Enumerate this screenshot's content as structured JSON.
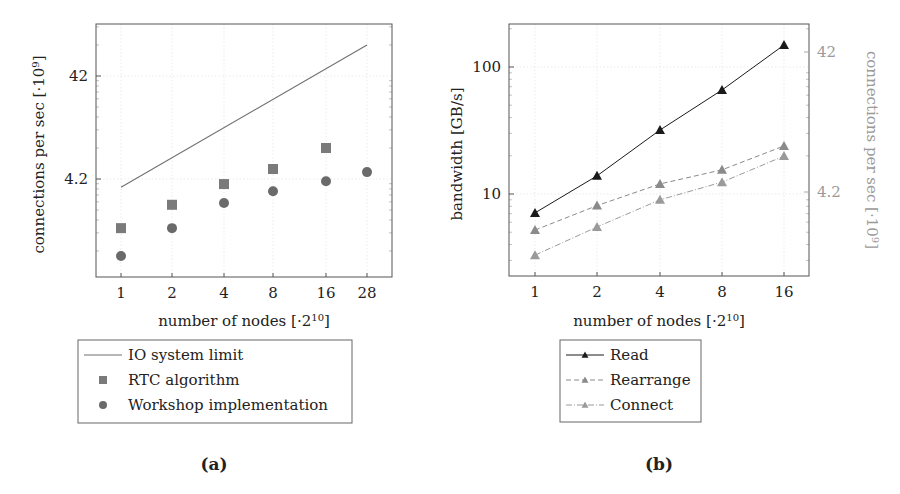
{
  "chart_data": [
    {
      "id": "a",
      "type": "scatter",
      "caption": "(a)",
      "title": "",
      "xlabel": "number of nodes [·2^10]",
      "xlabel_parts": {
        "base": "number of nodes [·2",
        "sup": "10",
        "end": "]"
      },
      "ylabel": "connections per sec [·10^9]",
      "ylabel_parts": {
        "base": "connections per sec [·10",
        "sup": "9",
        "end": "]"
      },
      "x": [
        1,
        2,
        4,
        8,
        16,
        28
      ],
      "x_tick_labels": [
        "1",
        "2",
        "4",
        "8",
        "16",
        "28"
      ],
      "y_scale": "log",
      "y_tick_labels": [
        "4.2",
        "42"
      ],
      "ylim": [
        0.6,
        120
      ],
      "grid": true,
      "legend_position": "below",
      "series": [
        {
          "name": "IO system limit",
          "style": "line",
          "color": "#707070",
          "x": [
            1,
            28
          ],
          "values": [
            3.5,
            84
          ]
        },
        {
          "name": "RTC algorithm",
          "style": "square-marker",
          "color": "#7a7a7a",
          "x": [
            1,
            2,
            4,
            8,
            16
          ],
          "values": [
            1.4,
            2.36,
            3.75,
            5.25,
            8.4
          ]
        },
        {
          "name": "Workshop implementation",
          "style": "circle-marker",
          "color": "#6a6a6a",
          "x": [
            1,
            2,
            4,
            8,
            16,
            28
          ],
          "values": [
            0.75,
            1.4,
            2.46,
            3.2,
            4.0,
            4.9
          ]
        }
      ]
    },
    {
      "id": "b",
      "type": "line",
      "caption": "(b)",
      "title": "",
      "xlabel": "number of nodes [·2^10]",
      "xlabel_parts": {
        "base": "number of nodes [·2",
        "sup": "10",
        "end": "]"
      },
      "ylabel": "bandwidth [GB/s]",
      "ylabel_right": "connections per sec [·10^9]",
      "ylabel_right_parts": {
        "base": "connections per sec [·10",
        "sup": "9",
        "end": "]"
      },
      "x": [
        1,
        2,
        4,
        8,
        16
      ],
      "x_tick_labels": [
        "1",
        "2",
        "4",
        "8",
        "16"
      ],
      "y_scale": "log",
      "y_tick_labels": [
        "10",
        "100"
      ],
      "y_right_tick_labels": [
        "4.2",
        "42"
      ],
      "ylim": [
        2.3,
        220
      ],
      "grid": true,
      "legend_position": "below",
      "series": [
        {
          "name": "Read",
          "style": "solid-triangle",
          "color": "#1a1a1a",
          "values": [
            7.1,
            13.9,
            31.9,
            65.9,
            149
          ]
        },
        {
          "name": "Rearrange",
          "style": "dashed-triangle",
          "color": "#8a8a8a",
          "values": [
            5.2,
            8.1,
            12.0,
            15.5,
            23.9
          ]
        },
        {
          "name": "Connect",
          "style": "dashdot-triangle",
          "color": "#9a9a9a",
          "values": [
            3.3,
            5.5,
            9.0,
            12.4,
            19.9
          ]
        }
      ]
    }
  ]
}
